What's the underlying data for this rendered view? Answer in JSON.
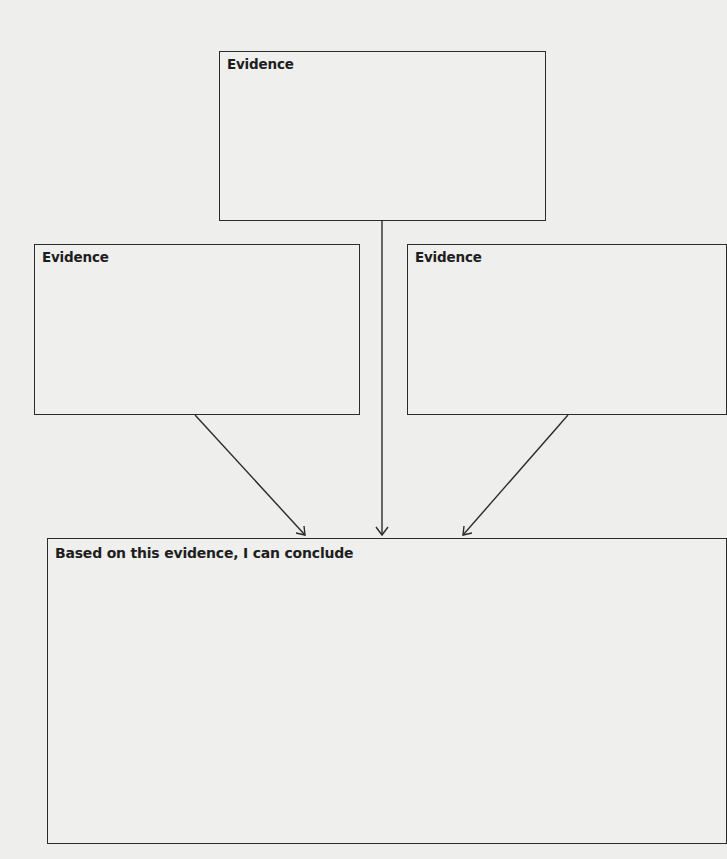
{
  "diagram": {
    "boxes": [
      {
        "id": "evidence-top",
        "label": "Evidence"
      },
      {
        "id": "evidence-left",
        "label": "Evidence"
      },
      {
        "id": "evidence-right",
        "label": "Evidence"
      },
      {
        "id": "conclusion",
        "label": "Based on this evidence, I can conclude"
      }
    ],
    "colors": {
      "line": "#2b2b2b",
      "background": "#eeeeec",
      "text": "#1e1e1e"
    }
  }
}
